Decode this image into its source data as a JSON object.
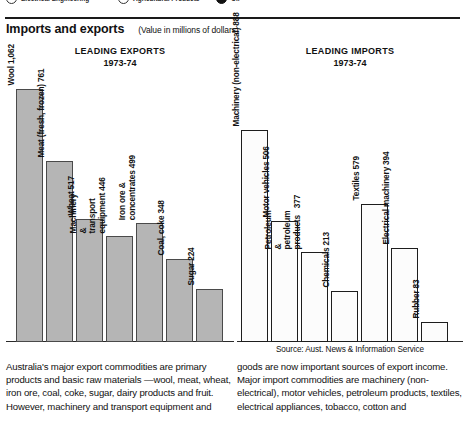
{
  "cutoff_strip": {
    "items": [
      {
        "icon": "circle-icon",
        "label": "Electrical Engineering",
        "x": 6,
        "filled": false
      },
      {
        "icon": "circle-icon",
        "label": "Agricultural Products",
        "x": 118,
        "filled": false
      },
      {
        "icon": "circle-filled-icon",
        "label": "Oil",
        "x": 216,
        "filled": true
      }
    ]
  },
  "header": {
    "title": "Imports and exports",
    "subtitle": "(Value in millions of dollars)"
  },
  "source_note": "Source: Aust. News & Information Service",
  "body_text": {
    "left": "Australia's major export commodities are primary products and basic raw materials —wool, meat, wheat, iron ore, coal, coke, sugar, dairy products and fruit. However, machinery and transport equipment and",
    "right": "goods are now important sources of export income. Major import commodities are machinery (non-electrical), motor vehicles, petroleum products, textiles, electrical appliances, tobacco, cotton and"
  },
  "chart_data": [
    {
      "type": "bar",
      "title": "LEADING EXPORTS",
      "subtitle": "1973-74",
      "xlabel": "",
      "ylabel": "Value in millions of dollars",
      "ylim": [
        0,
        1150
      ],
      "grid": false,
      "legend": "none",
      "orientation": "vertical",
      "bar_style": "gray-fill",
      "categories": [
        "Wool",
        "Meat (fresh, frozen)",
        "Wheat",
        "Machinery & transport equipment",
        "Iron ore & concentrates",
        "Coal, coke",
        "Sugar"
      ],
      "value_labels": [
        "1,062",
        "761",
        "517",
        "446",
        "499",
        "348",
        "224"
      ],
      "values": [
        1062,
        761,
        517,
        446,
        499,
        348,
        224
      ]
    },
    {
      "type": "bar",
      "title": "LEADING IMPORTS",
      "subtitle": "1973-74",
      "xlabel": "",
      "ylabel": "Value in millions of dollars",
      "ylim": [
        0,
        1150
      ],
      "grid": false,
      "legend": "none",
      "orientation": "vertical",
      "bar_style": "white-fill",
      "categories": [
        "Machinery (non-electrical)",
        "Motor vehicles",
        "Petroleum & petroleum products",
        "Chemicals",
        "Textiles",
        "Electrical machinery",
        "Rubber"
      ],
      "value_labels": [
        "888",
        "506",
        "377",
        "213",
        "579",
        "394",
        "83"
      ],
      "values": [
        888,
        506,
        377,
        213,
        579,
        394,
        83
      ]
    }
  ]
}
